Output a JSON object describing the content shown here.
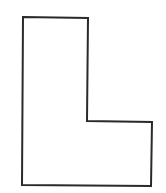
{
  "diagram": {
    "type": "shape-outline",
    "shape": "L-shape",
    "stroke_color": "#2a2a2a",
    "fill_color": "#ffffff",
    "background_color": "#ffffff",
    "stroke_width": 2,
    "points": [
      [
        23,
        17
      ],
      [
        88,
        18
      ],
      [
        87,
        121
      ],
      [
        152,
        122
      ],
      [
        151,
        186
      ],
      [
        22,
        185
      ]
    ]
  }
}
